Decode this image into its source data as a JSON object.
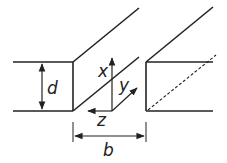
{
  "labels": {
    "d": "d",
    "b": "b",
    "x": "x",
    "y": "y",
    "z": "z"
  },
  "colors": {
    "stroke": "#222222",
    "background": "#ffffff"
  }
}
